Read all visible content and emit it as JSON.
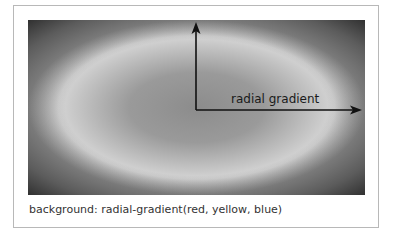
{
  "diagram": {
    "axis_label": "radial gradient",
    "caption": "background: radial-gradient(red, yellow, blue)",
    "colors": {
      "frame_border": "#b8b8b8",
      "gradient_center": "#8c8c8c",
      "gradient_ring": "#d2d2d2",
      "gradient_corner": "#3e3e3e",
      "arrow": "#111111",
      "caption_text": "#333333"
    },
    "icons": {
      "vertical_arrow": "arrow-up-icon",
      "horizontal_arrow": "arrow-right-icon"
    }
  }
}
